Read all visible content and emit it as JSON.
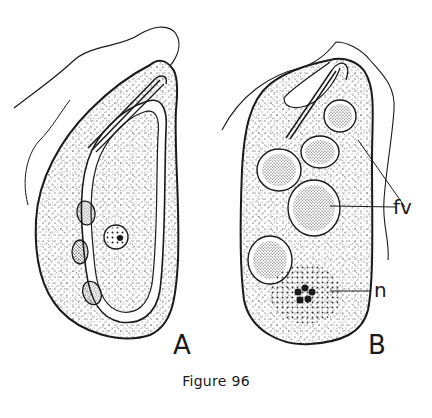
{
  "figure": {
    "caption": "Figure 96",
    "panels": [
      {
        "id": "A",
        "label": "A"
      },
      {
        "id": "B",
        "label": "B"
      }
    ],
    "annotations": {
      "food_vacuole": "fv",
      "nucleus": "n"
    }
  },
  "colors": {
    "ink": "#1a1a1a",
    "background": "#ffffff"
  }
}
